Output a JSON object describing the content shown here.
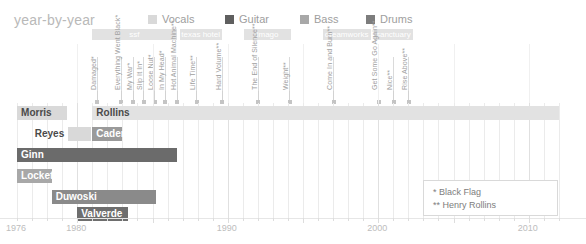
{
  "header": {
    "title": "year-by-year"
  },
  "legend": {
    "position": "top",
    "items": [
      {
        "label": "Vocals",
        "color": "#d9d9d9",
        "x": 148
      },
      {
        "label": "Guitar",
        "color": "#5f5f5f",
        "x": 225
      },
      {
        "label": "Bass",
        "color": "#a8a8a8",
        "x": 300
      },
      {
        "label": "Drums",
        "color": "#7d7d7d",
        "x": 366
      }
    ]
  },
  "axis": {
    "x_start_year": 1975,
    "x_end_year": 2012,
    "px_per_year": 15.05,
    "x_origin_px": 2,
    "ticks": [
      {
        "label": "1976",
        "year": 1976
      },
      {
        "label": "1980",
        "year": 1980
      },
      {
        "label": "1990",
        "year": 1990
      },
      {
        "label": "2000",
        "year": 2000
      },
      {
        "label": "2010",
        "year": 2010
      }
    ],
    "minor_every_years": 1
  },
  "labels_band": [
    {
      "name": "ssf",
      "start": 1981.0,
      "end": 1986.6
    },
    {
      "name": "texas hotel",
      "start": 1986.8,
      "end": 1989.6
    },
    {
      "name": "imago",
      "start": 1991.1,
      "end": 1994.2
    },
    {
      "name": "dreamworks",
      "start": 1996.3,
      "end": 1999.5
    },
    {
      "name": "sanctuary",
      "start": 1999.7,
      "end": 2002.3
    }
  ],
  "albums": [
    {
      "title": "Damaged*",
      "year": 1981.3
    },
    {
      "title": "Everything Went Black*",
      "year": 1982.9
    },
    {
      "title": "My War*",
      "year": 1983.7
    },
    {
      "title": "Slip It In*",
      "year": 1984.4
    },
    {
      "title": "Loose Nut*",
      "year": 1985.1
    },
    {
      "title": "In My Head*",
      "year": 1985.8
    },
    {
      "title": "Hot Animal Machine**",
      "year": 1986.6
    },
    {
      "title": "Life Time**",
      "year": 1987.9
    },
    {
      "title": "Hard Volume**",
      "year": 1989.6
    },
    {
      "title": "The End of Silence**",
      "year": 1992.0
    },
    {
      "title": "Weight**",
      "year": 1994.1
    },
    {
      "title": "Come In and Burn**",
      "year": 1997.0
    },
    {
      "title": "Get Some Go Again**",
      "year": 2000.0
    },
    {
      "title": "Nice**",
      "year": 2001.0
    },
    {
      "title": "Rise Above**",
      "year": 2002.0
    }
  ],
  "members": [
    {
      "name": "Morris",
      "role": "Vocals",
      "color": "#d9d9d9",
      "start": 1976.0,
      "end": 1979.3,
      "label_inside": false,
      "label_align": "inside-left"
    },
    {
      "name": "Rollins",
      "role": "Vocals",
      "color": "#e2e2e2",
      "start": 1981.0,
      "end": 2012.0,
      "label_inside": false,
      "label_align": "inside-left"
    },
    {
      "name": "Reyes",
      "role": "Vocals",
      "color": "#d9d9d9",
      "start": 1979.4,
      "end": 1980.9,
      "label_inside": false,
      "label_align": "outside-left"
    },
    {
      "name": "Cadena",
      "role": "Vocals",
      "color": "#9a9a9a",
      "start": 1981.0,
      "end": 1983.0,
      "label_inside": true,
      "label_align": "inside-left"
    },
    {
      "name": "Ginn",
      "role": "Guitar",
      "color": "#6b6b6b",
      "start": 1976.0,
      "end": 1986.6,
      "label_inside": true,
      "label_align": "inside-left"
    },
    {
      "name": "Lockett",
      "role": "Bass",
      "color": "#a8a8a8",
      "start": 1976.0,
      "end": 1978.3,
      "label_inside": true,
      "label_align": "inside-left"
    },
    {
      "name": "Duwoski",
      "role": "Drums",
      "color": "#8a8a8a",
      "start": 1978.3,
      "end": 1985.2,
      "label_inside": true,
      "label_align": "inside-left"
    },
    {
      "name": "Valverde",
      "role": "Drums",
      "color": "#6e6e6e",
      "start": 1980.0,
      "end": 1983.4,
      "label_inside": true,
      "label_align": "inside-left"
    }
  ],
  "footnotes": {
    "lines": [
      "* Black Flag",
      "** Henry Rollins"
    ]
  },
  "chart_data": {
    "type": "bar",
    "title": "year-by-year",
    "xlabel": "",
    "ylabel": "",
    "xlim": [
      1975,
      2012
    ],
    "grid": true,
    "orientation": "horizontal-timeline",
    "categories": [
      "Morris",
      "Rollins",
      "Reyes",
      "Cadena",
      "Ginn",
      "Lockett",
      "Duwoski",
      "Valverde"
    ],
    "series": [
      {
        "name": "Vocals",
        "color": "#d9d9d9",
        "spans": [
          {
            "category": "Morris",
            "start": 1976.0,
            "end": 1979.3
          },
          {
            "category": "Rollins",
            "start": 1981.0,
            "end": 2012.0
          },
          {
            "category": "Reyes",
            "start": 1979.4,
            "end": 1980.9
          },
          {
            "category": "Cadena",
            "start": 1981.0,
            "end": 1983.0
          }
        ]
      },
      {
        "name": "Guitar",
        "color": "#6b6b6b",
        "spans": [
          {
            "category": "Ginn",
            "start": 1976.0,
            "end": 1986.6
          }
        ]
      },
      {
        "name": "Bass",
        "color": "#a8a8a8",
        "spans": [
          {
            "category": "Lockett",
            "start": 1976.0,
            "end": 1978.3
          }
        ]
      },
      {
        "name": "Drums",
        "color": "#8a8a8a",
        "spans": [
          {
            "category": "Duwoski",
            "start": 1978.3,
            "end": 1985.2
          },
          {
            "category": "Valverde",
            "start": 1980.0,
            "end": 1983.4
          }
        ]
      }
    ],
    "annotations": {
      "record_labels": [
        "ssf",
        "texas hotel",
        "imago",
        "dreamworks",
        "sanctuary"
      ],
      "albums": [
        "Damaged*",
        "Everything Went Black*",
        "My War*",
        "Slip It In*",
        "Loose Nut*",
        "In My Head*",
        "Hot Animal Machine**",
        "Life Time**",
        "Hard Volume**",
        "The End of Silence**",
        "Weight**",
        "Come In and Burn**",
        "Get Some Go Again**",
        "Nice**",
        "Rise Above**"
      ],
      "footnotes": [
        "* Black Flag",
        "** Henry Rollins"
      ]
    }
  }
}
